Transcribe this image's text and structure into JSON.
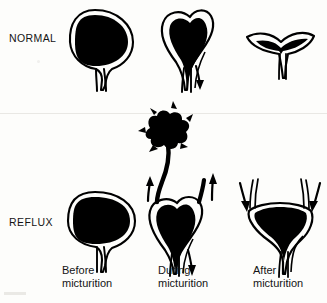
{
  "figure": {
    "background_color": "#fdfdfb",
    "ink_color": "#000000",
    "style": "black-and-white medical line drawing"
  },
  "rows": [
    {
      "id": "normal",
      "label": "NORMAL"
    },
    {
      "id": "reflux",
      "label": "REFLUX"
    }
  ],
  "columns": [
    {
      "id": "before",
      "caption_line1": "Before",
      "caption_line2": "micturition"
    },
    {
      "id": "during",
      "caption_line1": "During",
      "caption_line2": "micturition"
    },
    {
      "id": "after",
      "caption_line1": "After",
      "caption_line2": "micturition"
    }
  ],
  "panels": [
    {
      "row": "normal",
      "column": "before",
      "name": "normal-before-micturition",
      "description": "Round full bladder filled with urine, narrow urethra below, no ureteric reflux",
      "bladder_fill": "full",
      "bladder_shape": "round",
      "arrows": []
    },
    {
      "row": "normal",
      "column": "during",
      "name": "normal-during-micturition",
      "description": "Heart-shaped contracting bladder emptying through the urethra",
      "bladder_fill": "full",
      "bladder_shape": "heart",
      "arrows": [
        {
          "name": "urethral-outflow-arrow",
          "direction": "down",
          "side": "right"
        }
      ]
    },
    {
      "row": "normal",
      "column": "after",
      "name": "normal-after-micturition",
      "description": "Empty collapsed bladder, thin crescent outline with no residual urine",
      "bladder_fill": "empty",
      "bladder_shape": "crescent",
      "arrows": []
    },
    {
      "row": "reflux",
      "column": "before",
      "name": "reflux-before-micturition",
      "description": "Round full bladder filled with urine before voiding",
      "bladder_fill": "full",
      "bladder_shape": "round",
      "arrows": []
    },
    {
      "row": "reflux",
      "column": "during",
      "name": "reflux-during-micturition",
      "description": "Urine refluxes up both dilated ureters; left ureter leads to a clubbed dilated renal pelvis and calyces",
      "bladder_fill": "full",
      "bladder_shape": "heart",
      "arrows": [
        {
          "name": "left-ureteric-reflux-arrow",
          "direction": "up",
          "side": "left"
        },
        {
          "name": "right-ureteric-reflux-arrow",
          "direction": "up",
          "side": "right"
        },
        {
          "name": "urethral-outflow-arrow",
          "direction": "down",
          "side": "right"
        }
      ],
      "features": [
        {
          "name": "dilated-renal-pelvis-blob",
          "description": "clubbed dilated calyces at top of refluxing ureter"
        },
        {
          "name": "dilated-ureter",
          "description": "thickened tortuous ureter carrying refluxed urine"
        }
      ]
    },
    {
      "row": "reflux",
      "column": "after",
      "name": "reflux-after-micturition",
      "description": "Refluxed urine drains back down both ureters leaving residual urine in the bladder",
      "bladder_fill": "residual",
      "bladder_shape": "flattened",
      "arrows": [
        {
          "name": "left-ureteric-return-arrow",
          "direction": "down",
          "side": "left"
        },
        {
          "name": "right-ureteric-return-arrow",
          "direction": "down",
          "side": "right"
        }
      ]
    }
  ]
}
